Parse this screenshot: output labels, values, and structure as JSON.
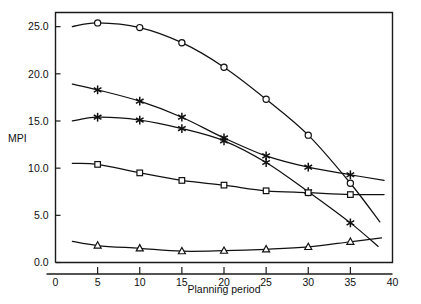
{
  "chart_data": {
    "type": "line",
    "title": "",
    "xlabel": "Planning period",
    "ylabel": "MPI",
    "xlim": [
      0,
      40
    ],
    "ylim": [
      0,
      26.5
    ],
    "grid": false,
    "legend": "none",
    "x_ticks": [
      "0",
      "5",
      "10",
      "15",
      "20",
      "25",
      "30",
      "35",
      "40"
    ],
    "x_tick_values": [
      0,
      5,
      10,
      15,
      20,
      25,
      30,
      35,
      40
    ],
    "y_ticks": [
      "0.0",
      "5.0",
      "10.0",
      "15.0",
      "20.0",
      "25.0"
    ],
    "y_tick_values": [
      0,
      5,
      10,
      15,
      20,
      25
    ],
    "x": [
      5,
      10,
      15,
      20,
      25,
      30,
      35
    ],
    "series": [
      {
        "name": "series-circle",
        "marker": "circle",
        "x": [
          5,
          10,
          15,
          20,
          25,
          30,
          35
        ],
        "values": [
          25.4,
          24.9,
          23.3,
          20.7,
          17.3,
          13.5,
          8.4
        ],
        "line_x": [
          2,
          5,
          10,
          15,
          20,
          25,
          30,
          35,
          38.5
        ],
        "line_y": [
          25.0,
          25.4,
          24.9,
          23.3,
          20.7,
          17.3,
          13.5,
          8.4,
          4.3
        ]
      },
      {
        "name": "series-star-upper",
        "marker": "star",
        "x": [
          5,
          10,
          15,
          20,
          25,
          30,
          35
        ],
        "values": [
          18.3,
          17.1,
          15.4,
          13.2,
          11.3,
          10.1,
          9.3
        ],
        "line_x": [
          2,
          5,
          10,
          15,
          20,
          25,
          30,
          35,
          39
        ],
        "line_y": [
          18.9,
          18.3,
          17.1,
          15.4,
          13.2,
          11.3,
          10.1,
          9.3,
          8.7
        ]
      },
      {
        "name": "series-star-lower",
        "marker": "star",
        "x": [
          5,
          10,
          15,
          20,
          25,
          30,
          35
        ],
        "values": [
          15.4,
          15.1,
          14.2,
          12.9,
          10.6,
          7.5,
          4.2
        ],
        "line_x": [
          2,
          5,
          10,
          15,
          20,
          25,
          30,
          35,
          38.3
        ],
        "line_y": [
          15.0,
          15.4,
          15.1,
          14.2,
          12.9,
          10.6,
          7.5,
          4.2,
          1.7
        ]
      },
      {
        "name": "series-square",
        "marker": "square",
        "x": [
          5,
          10,
          15,
          20,
          25,
          30,
          35
        ],
        "values": [
          10.4,
          9.5,
          8.7,
          8.2,
          7.6,
          7.4,
          7.2
        ],
        "line_x": [
          2,
          5,
          10,
          15,
          20,
          25,
          30,
          35,
          39
        ],
        "line_y": [
          10.5,
          10.4,
          9.5,
          8.7,
          8.2,
          7.6,
          7.4,
          7.2,
          7.2
        ]
      },
      {
        "name": "series-triangle",
        "marker": "triangle",
        "x": [
          5,
          10,
          15,
          20,
          25,
          30,
          35
        ],
        "values": [
          1.8,
          1.5,
          1.2,
          1.25,
          1.4,
          1.65,
          2.2
        ],
        "line_x": [
          2,
          5,
          10,
          15,
          20,
          25,
          30,
          35,
          38.7
        ],
        "line_y": [
          2.25,
          1.8,
          1.5,
          1.2,
          1.25,
          1.4,
          1.65,
          2.2,
          2.6
        ]
      }
    ]
  }
}
